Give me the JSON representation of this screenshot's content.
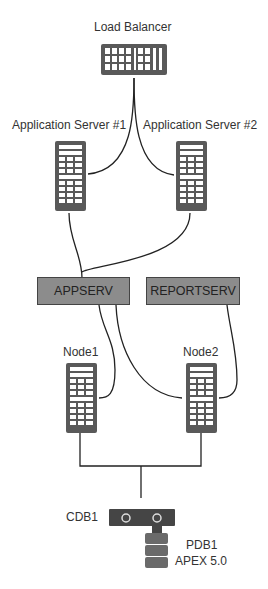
{
  "diagram": {
    "load_balancer": {
      "label": "Load Balancer"
    },
    "app_server_1": {
      "label": "Application Server #1"
    },
    "app_server_2": {
      "label": "Application Server #2"
    },
    "appserv": {
      "label": "APPSERV"
    },
    "reportserv": {
      "label": "REPORTSERV"
    },
    "node1": {
      "label": "Node1"
    },
    "node2": {
      "label": "Node2"
    },
    "cdb": {
      "label": "CDB1"
    },
    "pdb": {
      "label_line1": "PDB1",
      "label_line2": "APEX 5.0"
    },
    "colors": {
      "icon": "#595959",
      "box_fill": "#8c8c8c",
      "line": "#222222"
    }
  }
}
